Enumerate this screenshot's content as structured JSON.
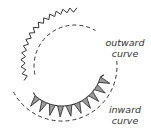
{
  "labels": {
    "outward": {
      "line1": "outward",
      "line2": "curve"
    },
    "inward": {
      "line1": "inward",
      "line2": "curve"
    }
  },
  "colors": {
    "stroke": "#333333",
    "notch_fill": "#9a9a9a",
    "background": "#ffffff"
  },
  "figure": {
    "outward_curve": {
      "edge": "zigzag (pinked/clipped)",
      "seamline": "dashed"
    },
    "inward_curve": {
      "edge": "notched (wedges cut out)",
      "seamline": "dashed"
    }
  }
}
